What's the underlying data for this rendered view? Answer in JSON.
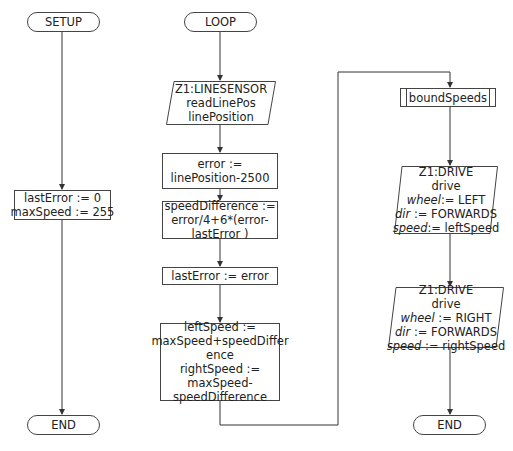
{
  "setup": {
    "start_label": "SETUP",
    "assign_lines": [
      "lastError := 0",
      "maxSpeed := 255"
    ],
    "end_label": "END"
  },
  "loop": {
    "start_label": "LOOP",
    "read_sensor": {
      "lines": [
        "Z1:LINESENSOR",
        "readLinePos",
        "linePosition"
      ]
    },
    "error_calc": {
      "lines": [
        "error :=",
        "linePosition-2500"
      ]
    },
    "speed_diff": {
      "lines": [
        "speedDifference :=",
        "error/4+6*(error-",
        "lastError )"
      ]
    },
    "last_error": {
      "lines": [
        "lastError := error"
      ]
    },
    "speeds": {
      "lines": [
        "leftSpeed :=",
        "maxSpeed+speedDiffer",
        "ence",
        "rightSpeed :=",
        "maxSpeed-",
        "speedDifference"
      ]
    },
    "bound_speeds_label": "boundSpeeds",
    "drive_left": {
      "lines": [
        "Z1:DRIVE",
        "drive"
      ],
      "params": [
        {
          "name": "wheel",
          "value": ":= LEFT"
        },
        {
          "name": "dir",
          "value": ":= FORWARDS"
        },
        {
          "name": "speed",
          "value": ":= leftSpeed"
        }
      ]
    },
    "drive_right": {
      "lines": [
        "Z1:DRIVE",
        "drive"
      ],
      "params": [
        {
          "name": "wheel",
          "value": ":= RIGHT"
        },
        {
          "name": "dir",
          "value": ":= FORWARDS"
        },
        {
          "name": "speed",
          "value": ":= rightSpeed"
        }
      ]
    },
    "end_label": "END"
  }
}
